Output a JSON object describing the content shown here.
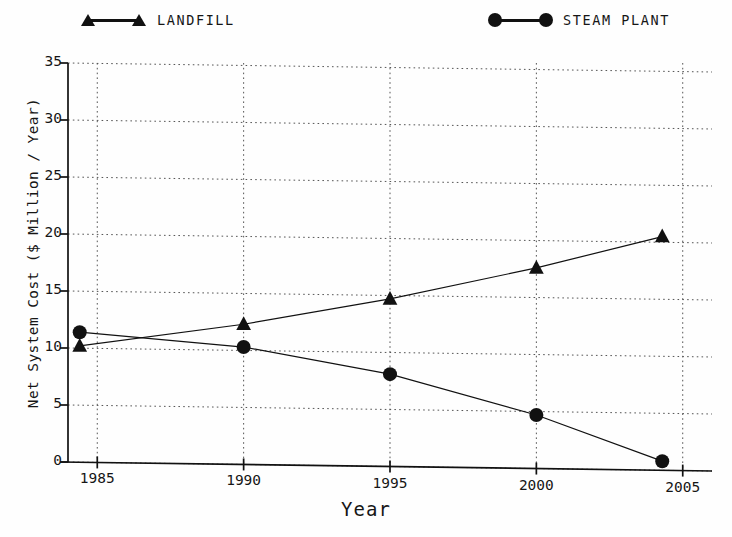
{
  "legend": {
    "position": "top",
    "entries": [
      {
        "label": "LANDFILL",
        "marker": "triangle-marker-icon"
      },
      {
        "label": "STEAM PLANT",
        "marker": "circle-marker-icon"
      }
    ]
  },
  "axes": {
    "x_title": "Year",
    "y_title": "Net System Cost ($ Million / Year)",
    "x_ticks": [
      "1985",
      "1990",
      "1995",
      "2000",
      "2005"
    ],
    "y_ticks": [
      "0",
      "5",
      "10",
      "15",
      "20",
      "25",
      "30",
      "35"
    ]
  },
  "chart_data": {
    "type": "line",
    "title": "",
    "xlabel": "Year",
    "ylabel": "Net System Cost ($ Million / Year)",
    "xlim": [
      1984,
      2006
    ],
    "ylim": [
      0,
      35
    ],
    "xticks": [
      1985,
      1990,
      1995,
      2000,
      2005
    ],
    "yticks": [
      0,
      5,
      10,
      15,
      20,
      25,
      30,
      35
    ],
    "grid": true,
    "legend_position": "top",
    "series": [
      {
        "name": "LANDFILL",
        "marker": "triangle",
        "color": "#111111",
        "x": [
          1984.4,
          1990,
          1995,
          2000,
          2004.3
        ],
        "values": [
          10.2,
          12.3,
          14.7,
          17.6,
          20.5
        ]
      },
      {
        "name": "STEAM PLANT",
        "marker": "circle",
        "color": "#111111",
        "x": [
          1984.4,
          1990,
          1995,
          2000,
          2004.3
        ],
        "values": [
          11.4,
          10.3,
          8.1,
          4.7,
          0.8
        ]
      }
    ]
  }
}
